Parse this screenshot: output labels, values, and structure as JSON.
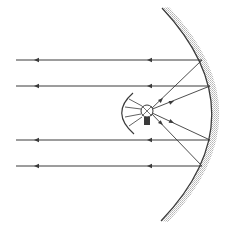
{
  "diagram": {
    "colors": {
      "background": "#ffffff",
      "line": "#3a3a3a",
      "mirror_shading": "#bdbdbd"
    },
    "mirror": {
      "top": [
        162,
        8
      ],
      "bottom": [
        161,
        221
      ],
      "apex": [
        212,
        115
      ]
    },
    "bulb": {
      "center": [
        147,
        111
      ],
      "radius": 6,
      "base": [
        147,
        125
      ]
    },
    "aux_reflector": {
      "top": [
        133,
        93
      ],
      "bottom": [
        134,
        134
      ],
      "apex": [
        122,
        113
      ]
    },
    "rays": [
      {
        "mirror_point": [
          202,
          60
        ],
        "y": 60,
        "x_end": 16
      },
      {
        "mirror_point": [
          210,
          86
        ],
        "y": 86,
        "x_end": 16
      },
      {
        "mirror_point": [
          210,
          140
        ],
        "y": 140,
        "x_end": 16
      },
      {
        "mirror_point": [
          202,
          166
        ],
        "y": 166,
        "x_end": 16
      }
    ]
  }
}
